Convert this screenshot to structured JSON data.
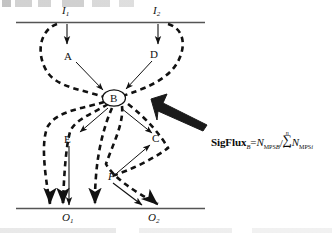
{
  "figure": {
    "type": "flow-diagram",
    "background_color": "#ffffff",
    "ink_color": "#111111",
    "top_scanline_artifact": true,
    "boundaries": [
      {
        "name": "input-layer-line",
        "y": 22,
        "x1": 16,
        "x2": 205,
        "style": "solid"
      },
      {
        "name": "output-layer-line",
        "y": 208,
        "x1": 16,
        "x2": 205,
        "style": "solid"
      }
    ],
    "inputs": [
      {
        "id": "I1",
        "label": "I",
        "subscript": "1",
        "x": 67,
        "y": 12
      },
      {
        "id": "I2",
        "label": "I",
        "subscript": "2",
        "x": 158,
        "y": 12
      }
    ],
    "outputs": [
      {
        "id": "O1",
        "label": "O",
        "subscript": "1",
        "x": 66,
        "y": 218
      },
      {
        "id": "O2",
        "label": "O",
        "subscript": "2",
        "x": 152,
        "y": 218
      }
    ],
    "nodes": [
      {
        "id": "A",
        "label": "A",
        "x": 68,
        "y": 57,
        "shape": "text"
      },
      {
        "id": "D",
        "label": "D",
        "x": 154,
        "y": 55,
        "shape": "text"
      },
      {
        "id": "B",
        "label": "B",
        "x": 114,
        "y": 98,
        "shape": "ellipse"
      },
      {
        "id": "E",
        "label": "E",
        "x": 68,
        "y": 140,
        "shape": "text"
      },
      {
        "id": "C",
        "label": "C",
        "x": 155,
        "y": 139,
        "shape": "text"
      },
      {
        "id": "F",
        "label": "F",
        "x": 111,
        "y": 177,
        "shape": "text"
      }
    ],
    "pointer_arrow": {
      "name": "highlight-arrow",
      "target_node": "B",
      "style": "thick-block-arrow",
      "from": [
        206,
        127
      ],
      "to": [
        150,
        99
      ]
    }
  },
  "formula": {
    "name": "sigflux-equation",
    "lhs_fn": "SigFlux",
    "lhs_sub": "B",
    "equals": "=",
    "numerator_var": "N",
    "numerator_sub": "MPS",
    "numerator_sub2": "B",
    "divider": "/",
    "sum_upper": "n",
    "sum_symbol": "∑",
    "sum_lower": "i=1",
    "denominator_var": "N",
    "denominator_sub": "MPS",
    "denominator_sub2": "i",
    "plain_text": "SigFlux_B = N_MPS_B / Σ(i=1..n) N_MPS_i"
  }
}
